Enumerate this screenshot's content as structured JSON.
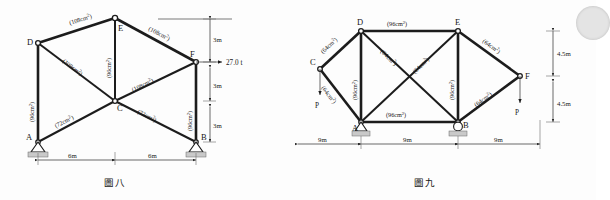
{
  "sheet": {
    "background_color": "#fdfdfd",
    "ink_color": "#1c1c1c"
  },
  "figure_left": {
    "caption": "圖八",
    "nodes": [
      {
        "id": "A",
        "label": "A"
      },
      {
        "id": "B",
        "label": "B"
      },
      {
        "id": "C",
        "label": "C"
      },
      {
        "id": "D",
        "label": "D"
      },
      {
        "id": "E",
        "label": "E"
      },
      {
        "id": "F",
        "label": "F"
      }
    ],
    "members": [
      {
        "from": "D",
        "to": "E",
        "area": "(108cm",
        "area_sup": "2",
        "area_tail": ")"
      },
      {
        "from": "E",
        "to": "F",
        "area": "(108cm",
        "area_sup": "2",
        "area_tail": ")"
      },
      {
        "from": "D",
        "to": "C",
        "area": "(108cm",
        "area_sup": "2",
        "area_tail": ")"
      },
      {
        "from": "C",
        "to": "F",
        "area": "(108cm",
        "area_sup": "2",
        "area_tail": ")"
      },
      {
        "from": "E",
        "to": "C",
        "area": "(96cm",
        "area_sup": "2",
        "area_tail": ")"
      },
      {
        "from": "D",
        "to": "A",
        "area": "(96cm",
        "area_sup": "2",
        "area_tail": ")"
      },
      {
        "from": "F",
        "to": "B",
        "area": "(96cm",
        "area_sup": "2",
        "area_tail": ")"
      },
      {
        "from": "A",
        "to": "C",
        "area": "(72cm",
        "area_sup": "2",
        "area_tail": ")"
      },
      {
        "from": "C",
        "to": "B",
        "area": "(72cm",
        "area_sup": "2",
        "area_tail": ")"
      }
    ],
    "area_labels": {
      "de": "(108cm",
      "ef": "(108cm",
      "dc": "(108cm",
      "cf": "(108cm",
      "ec": "(96cm",
      "da": "(96cm",
      "fb": "(96cm",
      "ac": "(72cm",
      "cb": "(72cm",
      "sup": "2",
      "tail": ")"
    },
    "dimensions": {
      "vertical": [
        "3m",
        "3m",
        "3m"
      ],
      "horizontal": [
        "6m",
        "6m"
      ]
    },
    "load": {
      "label": "27.0 t",
      "applied_at": "F",
      "direction": "horizontal-right"
    },
    "supports": [
      {
        "node": "A",
        "type": "pin"
      },
      {
        "node": "B",
        "type": "pin"
      }
    ]
  },
  "figure_right": {
    "caption": "圖九",
    "nodes": [
      {
        "id": "A",
        "label": "A"
      },
      {
        "id": "B",
        "label": "B"
      },
      {
        "id": "C",
        "label": "C"
      },
      {
        "id": "D",
        "label": "D"
      },
      {
        "id": "E",
        "label": "E"
      },
      {
        "id": "F",
        "label": "F"
      }
    ],
    "area_labels": {
      "cd": "(64cm",
      "ca": "(64cm",
      "de_top": "(96cm",
      "db": "(64cm",
      "ea": "(64cm",
      "da": "(96cm",
      "eb": "(96cm",
      "ab": "(96cm",
      "ef": "(64cm",
      "bf": "(64cm",
      "sup": "2",
      "tail": ")"
    },
    "dimensions": {
      "vertical": [
        "4.5m",
        "4.5m"
      ],
      "horizontal": [
        "9m",
        "9m",
        "9m"
      ]
    },
    "loads": [
      {
        "label": "P",
        "applied_at": "C",
        "direction": "down"
      },
      {
        "label": "P",
        "applied_at": "F",
        "direction": "down"
      }
    ],
    "supports": [
      {
        "node": "A",
        "type": "pin"
      },
      {
        "node": "B",
        "type": "roller"
      }
    ]
  }
}
